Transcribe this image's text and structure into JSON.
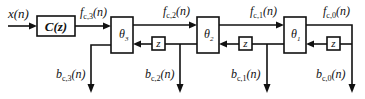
{
  "diagram": {
    "type": "lattice-filter-block-diagram",
    "input": {
      "label": "x(n)"
    },
    "prefilter": {
      "label": "C(z)"
    },
    "stages": [
      {
        "block": "θ",
        "sub": "3",
        "forward_in": {
          "f": "f",
          "sub": "c,3",
          "arg": "(n)"
        },
        "backward_out": {
          "f": "b",
          "sub": "c,3",
          "arg": "(n)"
        }
      },
      {
        "block": "θ",
        "sub": "2",
        "forward_in": {
          "f": "f",
          "sub": "c,2",
          "arg": "(n)"
        },
        "backward_out": {
          "f": "b",
          "sub": "c,2",
          "arg": "(n)"
        }
      },
      {
        "block": "θ",
        "sub": "1",
        "forward_in": {
          "f": "f",
          "sub": "c,1",
          "arg": "(n)"
        },
        "backward_out": {
          "f": "b",
          "sub": "c,1",
          "arg": "(n)"
        }
      }
    ],
    "final": {
      "forward": {
        "f": "f",
        "sub": "c,0",
        "arg": "(n)"
      },
      "backward": {
        "f": "b",
        "sub": "c,0",
        "arg": "(n)"
      }
    },
    "delay_label": "z",
    "colors": {
      "line": "#111111",
      "background": "#ffffff"
    }
  }
}
